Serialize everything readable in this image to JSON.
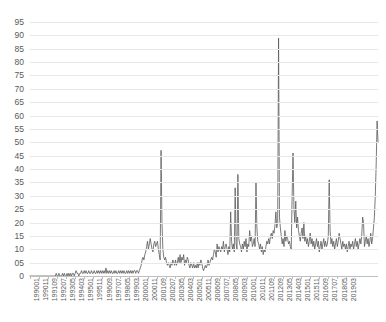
{
  "chart_data": {
    "type": "line",
    "title": "",
    "xlabel": "",
    "ylabel": "",
    "ylim": [
      0,
      95
    ],
    "grid": true,
    "legend": "none",
    "line_color": "#595959",
    "y_ticks": [
      "0",
      "05",
      "10",
      "15",
      "20",
      "25",
      "30",
      "35",
      "40",
      "45",
      "50",
      "55",
      "60",
      "65",
      "70",
      "75",
      "80",
      "85",
      "90",
      "95"
    ],
    "y_tick_values": [
      0,
      5,
      10,
      15,
      20,
      25,
      30,
      35,
      40,
      45,
      50,
      55,
      60,
      65,
      70,
      75,
      80,
      85,
      90,
      95
    ],
    "x_tick_labels": [
      "199001",
      "199011",
      "199109",
      "199207",
      "199305",
      "199403",
      "199501",
      "199511",
      "199609",
      "199707",
      "199805",
      "199903",
      "200001",
      "200011",
      "200109",
      "200207",
      "200305",
      "200403",
      "200501",
      "200511",
      "200609",
      "200707",
      "200805",
      "200903",
      "201001",
      "201011",
      "201109",
      "201209",
      "201305",
      "201403",
      "201501",
      "201511",
      "201609",
      "201707",
      "201805",
      "201903"
    ],
    "x_tick_step": 10,
    "x_start": "199001",
    "x_end": "201903",
    "x_categories": [
      "199001",
      "199002",
      "199003",
      "199004",
      "199005",
      "199006",
      "199007",
      "199008",
      "199009",
      "199010",
      "199011",
      "199012",
      "199101",
      "199102",
      "199103",
      "199104",
      "199105",
      "199106",
      "199107",
      "199108",
      "199109",
      "199110",
      "199111",
      "199112",
      "199201",
      "199202",
      "199203",
      "199204",
      "199205",
      "199206",
      "199207",
      "199208",
      "199209",
      "199210",
      "199211",
      "199212",
      "199301",
      "199302",
      "199303",
      "199304",
      "199305",
      "199306",
      "199307",
      "199308",
      "199309",
      "199310",
      "199311",
      "199312",
      "199401",
      "199402",
      "199403",
      "199404",
      "199405",
      "199406",
      "199407",
      "199408",
      "199409",
      "199410",
      "199411",
      "199412",
      "199501",
      "199502",
      "199503",
      "199504",
      "199505",
      "199506",
      "199507",
      "199508",
      "199509",
      "199510",
      "199511",
      "199512",
      "199601",
      "199602",
      "199603",
      "199604",
      "199605",
      "199606",
      "199607",
      "199608",
      "199609",
      "199610",
      "199611",
      "199612",
      "199701",
      "199702",
      "199703",
      "199704",
      "199705",
      "199706",
      "199707",
      "199708",
      "199709",
      "199710",
      "199711",
      "199712",
      "199801",
      "199802",
      "199803",
      "199804",
      "199805",
      "199806",
      "199807",
      "199808",
      "199809",
      "199810",
      "199811",
      "199812",
      "199901",
      "199902",
      "199903",
      "199904",
      "199905",
      "199906",
      "199907",
      "199908",
      "199909",
      "199910",
      "199911",
      "199912",
      "200001",
      "200002",
      "200003",
      "200004",
      "200005",
      "200006",
      "200007",
      "200008",
      "200009",
      "200010",
      "200011",
      "200012",
      "200101",
      "200102",
      "200103",
      "200104",
      "200105",
      "200106",
      "200107",
      "200108",
      "200109",
      "200110",
      "200111",
      "200112",
      "200201",
      "200202",
      "200203",
      "200204",
      "200205",
      "200206",
      "200207",
      "200208",
      "200209",
      "200210",
      "200211",
      "200212",
      "200301",
      "200302",
      "200303",
      "200304",
      "200305",
      "200306",
      "200307",
      "200308",
      "200309",
      "200310",
      "200311",
      "200312",
      "200401",
      "200402",
      "200403",
      "200404",
      "200405",
      "200406",
      "200407",
      "200408",
      "200409",
      "200410",
      "200411",
      "200412",
      "200501",
      "200502",
      "200503",
      "200504",
      "200505",
      "200506",
      "200507",
      "200508",
      "200509",
      "200510",
      "200511",
      "200512",
      "200601",
      "200602",
      "200603",
      "200604",
      "200605",
      "200606",
      "200607",
      "200608",
      "200609",
      "200610",
      "200611",
      "200612",
      "200701",
      "200702",
      "200703",
      "200704",
      "200705",
      "200706",
      "200707",
      "200708",
      "200709",
      "200710",
      "200711",
      "200712",
      "200801",
      "200802",
      "200803",
      "200804",
      "200805",
      "200806",
      "200807",
      "200808",
      "200809",
      "200810",
      "200811",
      "200812",
      "200901",
      "200902",
      "200903",
      "200904",
      "200905",
      "200906",
      "200907",
      "200908",
      "200909",
      "200910",
      "200911",
      "200912",
      "201001",
      "201002",
      "201003",
      "201004",
      "201005",
      "201006",
      "201007",
      "201008",
      "201009",
      "201010",
      "201011",
      "201012",
      "201101",
      "201102",
      "201103",
      "201104",
      "201105",
      "201106",
      "201107",
      "201108",
      "201109",
      "201110",
      "201111",
      "201112",
      "201201",
      "201202",
      "201203",
      "201204",
      "201205",
      "201206",
      "201207",
      "201208",
      "201209",
      "201210",
      "201211",
      "201212",
      "201301",
      "201302",
      "201303",
      "201304",
      "201305",
      "201306",
      "201307",
      "201308",
      "201309",
      "201310",
      "201311",
      "201312",
      "201401",
      "201402",
      "201403",
      "201404",
      "201405",
      "201406",
      "201407",
      "201408",
      "201409",
      "201410",
      "201411",
      "201412",
      "201501",
      "201502",
      "201503",
      "201504",
      "201505",
      "201506",
      "201507",
      "201508",
      "201509",
      "201510",
      "201511",
      "201512",
      "201601",
      "201602",
      "201603",
      "201604",
      "201605",
      "201606",
      "201607",
      "201608",
      "201609",
      "201610",
      "201611",
      "201612",
      "201701",
      "201702",
      "201703",
      "201704",
      "201705",
      "201706",
      "201707",
      "201708",
      "201709",
      "201710",
      "201711",
      "201712",
      "201801",
      "201802",
      "201803",
      "201804",
      "201805",
      "201806",
      "201807",
      "201808",
      "201809",
      "201810",
      "201811",
      "201812",
      "201901",
      "201902",
      "201903"
    ],
    "values": [
      0,
      0,
      0,
      0,
      0,
      0,
      0,
      0,
      0,
      0,
      0,
      0,
      0,
      0,
      0,
      0,
      0,
      0,
      0,
      0,
      0,
      0,
      0,
      0,
      0,
      0,
      0,
      0,
      0,
      1,
      0,
      0,
      1,
      0,
      0,
      0,
      1,
      0,
      1,
      0,
      0,
      1,
      0,
      1,
      0,
      1,
      0,
      1,
      1,
      0,
      1,
      2,
      1,
      1,
      0,
      1,
      1,
      2,
      1,
      1,
      2,
      1,
      2,
      1,
      1,
      2,
      1,
      1,
      2,
      1,
      1,
      2,
      1,
      1,
      2,
      1,
      2,
      1,
      2,
      1,
      2,
      1,
      2,
      1,
      3,
      1,
      2,
      1,
      2,
      1,
      2,
      1,
      1,
      2,
      1,
      2,
      1,
      1,
      2,
      1,
      2,
      1,
      2,
      1,
      2,
      1,
      1,
      2,
      1,
      2,
      1,
      2,
      1,
      2,
      1,
      2,
      2,
      1,
      2,
      2,
      1,
      2,
      3,
      4,
      6,
      7,
      6,
      8,
      9,
      11,
      13,
      10,
      12,
      14,
      12,
      10,
      9,
      12,
      13,
      11,
      12,
      13,
      10,
      8,
      6,
      47,
      20,
      10,
      7,
      6,
      7,
      5,
      4,
      5,
      4,
      3,
      5,
      4,
      6,
      5,
      4,
      6,
      4,
      5,
      7,
      5,
      8,
      5,
      7,
      6,
      8,
      4,
      6,
      5,
      7,
      6,
      4,
      3,
      5,
      4,
      3,
      5,
      3,
      4,
      3,
      5,
      3,
      5,
      4,
      6,
      5,
      3,
      2,
      3,
      4,
      3,
      4,
      6,
      4,
      5,
      6,
      7,
      6,
      8,
      10,
      9,
      7,
      12,
      9,
      11,
      10,
      9,
      11,
      10,
      13,
      9,
      11,
      12,
      10,
      8,
      11,
      9,
      24,
      13,
      10,
      12,
      9,
      33,
      12,
      10,
      38,
      14,
      12,
      11,
      9,
      12,
      10,
      13,
      11,
      14,
      9,
      12,
      11,
      17,
      13,
      15,
      11,
      12,
      14,
      11,
      35,
      18,
      13,
      12,
      10,
      12,
      9,
      11,
      8,
      10,
      9,
      11,
      13,
      12,
      14,
      12,
      15,
      16,
      14,
      17,
      16,
      19,
      24,
      18,
      20,
      89,
      22,
      18,
      15,
      12,
      14,
      11,
      17,
      13,
      15,
      14,
      12,
      13,
      11,
      10,
      30,
      46,
      25,
      20,
      28,
      18,
      22,
      17,
      15,
      13,
      16,
      18,
      14,
      20,
      13,
      15,
      12,
      14,
      11,
      13,
      16,
      12,
      14,
      11,
      13,
      10,
      12,
      14,
      11,
      13,
      9,
      11,
      13,
      10,
      12,
      14,
      11,
      13,
      11,
      12,
      15,
      36,
      17,
      12,
      14,
      11,
      13,
      10,
      12,
      14,
      11,
      13,
      16,
      14,
      12,
      10,
      13,
      11,
      12,
      10,
      12,
      9,
      11,
      13,
      10,
      12,
      11,
      13,
      10,
      12,
      14,
      11,
      13,
      10,
      12,
      14,
      12,
      15,
      22,
      20,
      11,
      13,
      15,
      12,
      14,
      11,
      13,
      16,
      12,
      14,
      18,
      22,
      30,
      42,
      58,
      50
    ]
  }
}
